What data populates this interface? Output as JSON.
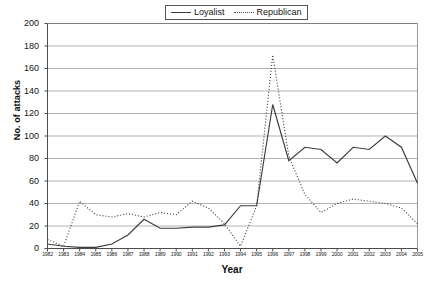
{
  "chart_data": {
    "type": "line",
    "title": "",
    "xlabel": "Year",
    "ylabel": "No. of attacks",
    "xlim": [
      1982,
      2005
    ],
    "ylim": [
      0,
      200
    ],
    "ytick_step": 20,
    "grid": true,
    "legend_position": "top-center",
    "categories": [
      "1982",
      "1983",
      "1984",
      "1985",
      "1986",
      "1987",
      "1988",
      "1989",
      "1990",
      "1991",
      "1992",
      "1993",
      "1994",
      "1995",
      "1996",
      "1997",
      "1998",
      "1999",
      "2000",
      "2001",
      "2002",
      "2003",
      "2004",
      "2005"
    ],
    "series": [
      {
        "name": "Loyalist",
        "style": "solid",
        "color": "#3c3c3c",
        "values": [
          4,
          2,
          1,
          1,
          4,
          12,
          26,
          18,
          18,
          19,
          19,
          21,
          38,
          38,
          128,
          78,
          90,
          88,
          76,
          90,
          88,
          100,
          90,
          58
        ]
      },
      {
        "name": "Republican",
        "style": "dotted",
        "color": "#4a4a4a",
        "values": [
          8,
          2,
          42,
          30,
          28,
          31,
          28,
          32,
          30,
          42,
          36,
          22,
          2,
          38,
          172,
          82,
          48,
          32,
          40,
          44,
          42,
          40,
          36,
          22
        ]
      }
    ],
    "ytick_labels": [
      "0",
      "20",
      "40",
      "60",
      "80",
      "100",
      "120",
      "140",
      "160",
      "180",
      "200"
    ]
  },
  "legend": {
    "entries": [
      {
        "label": "Loyalist",
        "style": "solid"
      },
      {
        "label": "Republican",
        "style": "dotted"
      }
    ]
  }
}
